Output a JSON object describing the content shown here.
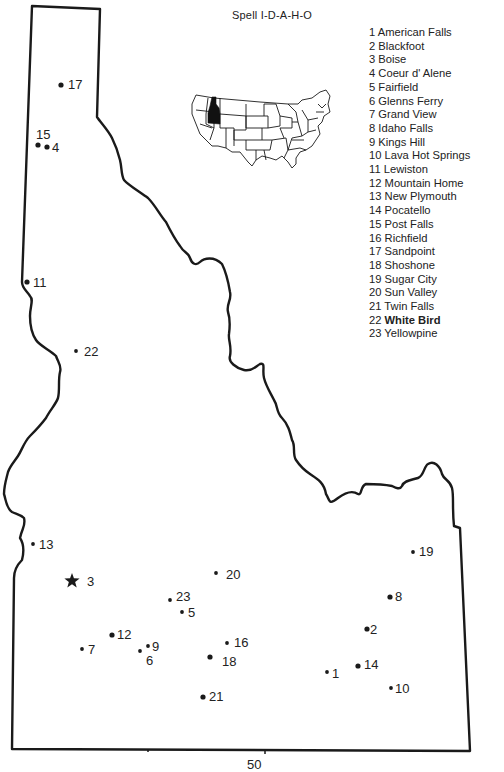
{
  "title": "Spell I-D-A-H-O",
  "page_number": "50",
  "inset": {
    "name": "us-inset-map",
    "highlighted_state": "Idaho",
    "highlight_color": "#111111"
  },
  "colors": {
    "outline": "#1a1a1a",
    "background": "#ffffff"
  },
  "legend": [
    {
      "num": "1",
      "name": "American Falls"
    },
    {
      "num": "2",
      "name": "Blackfoot"
    },
    {
      "num": "3",
      "name": "Boise"
    },
    {
      "num": "4",
      "name": "Coeur d' Alene"
    },
    {
      "num": "5",
      "name": "Fairfield"
    },
    {
      "num": "6",
      "name": "Glenns Ferry"
    },
    {
      "num": "7",
      "name": "Grand View"
    },
    {
      "num": "8",
      "name": "Idaho Falls"
    },
    {
      "num": "9",
      "name": "Kings Hill"
    },
    {
      "num": "10",
      "name": "Lava Hot Springs"
    },
    {
      "num": "11",
      "name": "Lewiston"
    },
    {
      "num": "12",
      "name": "Mountain Home"
    },
    {
      "num": "13",
      "name": "New Plymouth"
    },
    {
      "num": "14",
      "name": "Pocatello"
    },
    {
      "num": "15",
      "name": "Post Falls"
    },
    {
      "num": "16",
      "name": "Richfield"
    },
    {
      "num": "17",
      "name": "Sandpoint"
    },
    {
      "num": "18",
      "name": "Shoshone"
    },
    {
      "num": "19",
      "name": "Sugar City"
    },
    {
      "num": "20",
      "name": "Sun Valley"
    },
    {
      "num": "21",
      "name": "Twin Falls"
    },
    {
      "num": "22",
      "name": "White Bird"
    },
    {
      "num": "23",
      "name": "Yellowpine"
    }
  ],
  "cities": [
    {
      "num": "1",
      "marker": "dot",
      "x": 327,
      "y": 672,
      "lx": 332,
      "ly": 667
    },
    {
      "num": "2",
      "marker": "dot",
      "x": 367,
      "y": 629,
      "lx": 370,
      "ly": 623
    },
    {
      "num": "3",
      "marker": "star",
      "x": 72,
      "y": 581,
      "lx": 87,
      "ly": 575
    },
    {
      "num": "4",
      "marker": "dot",
      "x": 47,
      "y": 147,
      "lx": 52,
      "ly": 141
    },
    {
      "num": "5",
      "marker": "dot",
      "x": 182,
      "y": 612,
      "lx": 188,
      "ly": 606
    },
    {
      "num": "6",
      "marker": "dot",
      "x": 140,
      "y": 651,
      "lx": 146,
      "ly": 654
    },
    {
      "num": "7",
      "marker": "dot",
      "x": 82,
      "y": 649,
      "lx": 88,
      "ly": 643
    },
    {
      "num": "8",
      "marker": "dot",
      "x": 390,
      "y": 597,
      "lx": 395,
      "ly": 590
    },
    {
      "num": "9",
      "marker": "dot",
      "x": 148,
      "y": 646,
      "lx": 152,
      "ly": 640
    },
    {
      "num": "10",
      "marker": "dot",
      "x": 391,
      "y": 688,
      "lx": 395,
      "ly": 682
    },
    {
      "num": "11",
      "marker": "dot",
      "x": 27,
      "y": 282,
      "lx": 33,
      "ly": 276
    },
    {
      "num": "12",
      "marker": "dot",
      "x": 112,
      "y": 635,
      "lx": 117,
      "ly": 628
    },
    {
      "num": "13",
      "marker": "dot",
      "x": 33,
      "y": 544,
      "lx": 39,
      "ly": 538
    },
    {
      "num": "14",
      "marker": "dot",
      "x": 358,
      "y": 666,
      "lx": 364,
      "ly": 658
    },
    {
      "num": "15",
      "marker": "dot",
      "x": 38,
      "y": 145,
      "lx": 36,
      "ly": 128
    },
    {
      "num": "16",
      "marker": "dot",
      "x": 227,
      "y": 643,
      "lx": 234,
      "ly": 636
    },
    {
      "num": "17",
      "marker": "dot",
      "x": 61,
      "y": 85,
      "lx": 68,
      "ly": 78
    },
    {
      "num": "18",
      "marker": "dot",
      "x": 210,
      "y": 657,
      "lx": 222,
      "ly": 655
    },
    {
      "num": "19",
      "marker": "dot",
      "x": 413,
      "y": 552,
      "lx": 419,
      "ly": 545
    },
    {
      "num": "20",
      "marker": "dot",
      "x": 216,
      "y": 573,
      "lx": 226,
      "ly": 568
    },
    {
      "num": "21",
      "marker": "dot",
      "x": 203,
      "y": 697,
      "lx": 209,
      "ly": 690
    },
    {
      "num": "22",
      "marker": "dot",
      "x": 76,
      "y": 351,
      "lx": 84,
      "ly": 345
    },
    {
      "num": "23",
      "marker": "dot",
      "x": 170,
      "y": 600,
      "lx": 176,
      "ly": 590
    }
  ]
}
